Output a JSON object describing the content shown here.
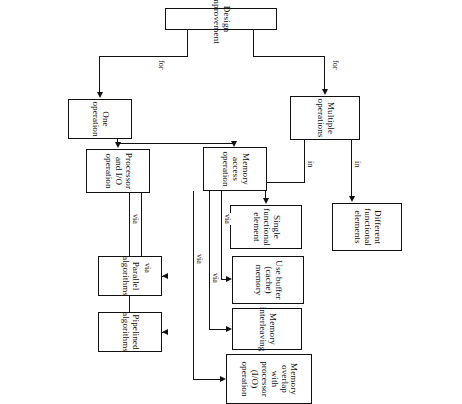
{
  "diagram": {
    "title": "Design improvement",
    "orientation": "rotated-90-clockwise",
    "nodes": {
      "root": "Design improvement",
      "multiple_operations": "Multiple operations",
      "one_operation": "One operation",
      "different_functional_elements": "Different functional elements",
      "single_functional_element": "Single functional element",
      "memory_access_operation": "Memory access operation",
      "processor_io_operation": "Processor and I/O operation",
      "use_buffer_cache_memory": "Use buffer (cache) memory",
      "memory_interleaving": "Memory interleaving",
      "memory_overlap": "Memory overlap with processor (I/O) operation",
      "parallel_algorithms": "Parallel algorithms",
      "pipelined_algorithms": "Pipelined algorithms"
    },
    "edge_labels": {
      "for_multiple": "for",
      "for_one": "for",
      "in_different": "in",
      "in_single": "in",
      "via_cache": "via",
      "via_interleaving": "via",
      "via_overlap": "via",
      "via_parallel": "via",
      "via_pipelined": "via"
    },
    "colors": {
      "stroke": "#111111",
      "background": "#ffffff"
    }
  }
}
